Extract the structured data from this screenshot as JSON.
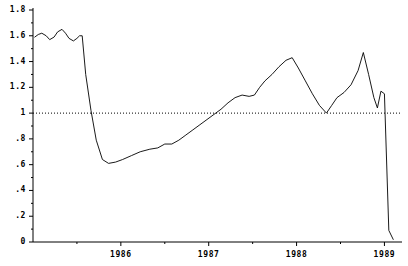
{
  "chart_data": {
    "type": "line",
    "title": "",
    "subtitle": "",
    "xlabel": "",
    "ylabel": "",
    "xlim": [
      1985.0,
      1989.2
    ],
    "ylim": [
      0,
      1.8
    ],
    "grid": false,
    "legend": null,
    "legend_position": "none",
    "line_color": "#000000",
    "axis_color": "#000000",
    "background_color": "#ffffff",
    "reference_line": {
      "name": "unit-reference-line",
      "axis": "y",
      "value": 1.0,
      "style": "dotted",
      "color": "#000000",
      "label": ""
    },
    "y_ticks": [
      0,
      0.2,
      0.4,
      0.6,
      0.8,
      1.0,
      1.2,
      1.4,
      1.6,
      1.8
    ],
    "y_tick_labels": [
      "0",
      ".2",
      ".4",
      ".6",
      ".8",
      "1",
      "1.2",
      "1.4",
      "1.6",
      "1.8"
    ],
    "y_minor_ticks": [
      0.1,
      0.3,
      0.5,
      0.7,
      0.9,
      1.1,
      1.3,
      1.5,
      1.7
    ],
    "x_ticks": [
      1986,
      1987,
      1988,
      1989
    ],
    "x_tick_labels": [
      "1986",
      "1987",
      "1988",
      "1989"
    ],
    "x_minor_ticks": [
      1985.5,
      1986.5,
      1987.5,
      1988.5
    ],
    "series": [
      {
        "name": "ratio-series",
        "color": "#000000",
        "x": [
          1985.02,
          1985.06,
          1985.1,
          1985.15,
          1985.19,
          1985.24,
          1985.28,
          1985.33,
          1985.37,
          1985.41,
          1985.46,
          1985.5,
          1985.53,
          1985.56,
          1985.6,
          1985.66,
          1985.72,
          1985.79,
          1985.86,
          1985.94,
          1986.02,
          1986.12,
          1986.22,
          1986.33,
          1986.42,
          1986.5,
          1986.58,
          1986.66,
          1986.74,
          1986.82,
          1986.9,
          1986.98,
          1987.06,
          1987.14,
          1987.22,
          1987.3,
          1987.38,
          1987.46,
          1987.52,
          1987.58,
          1987.64,
          1987.72,
          1987.8,
          1987.88,
          1987.95,
          1988.02,
          1988.1,
          1988.18,
          1988.26,
          1988.34,
          1988.4,
          1988.46,
          1988.54,
          1988.62,
          1988.7,
          1988.76,
          1988.82,
          1988.88,
          1988.92,
          1988.96,
          1989.0,
          1989.05,
          1989.1
        ],
        "y": [
          1.59,
          1.61,
          1.62,
          1.6,
          1.57,
          1.59,
          1.63,
          1.65,
          1.62,
          1.58,
          1.56,
          1.58,
          1.6,
          1.6,
          1.3,
          1.02,
          0.79,
          0.64,
          0.61,
          0.62,
          0.64,
          0.67,
          0.7,
          0.72,
          0.73,
          0.76,
          0.76,
          0.79,
          0.83,
          0.87,
          0.91,
          0.95,
          0.99,
          1.03,
          1.08,
          1.12,
          1.14,
          1.13,
          1.14,
          1.2,
          1.25,
          1.3,
          1.36,
          1.41,
          1.43,
          1.35,
          1.25,
          1.15,
          1.06,
          1.0,
          1.06,
          1.12,
          1.16,
          1.22,
          1.33,
          1.47,
          1.3,
          1.12,
          1.04,
          1.17,
          1.15,
          0.09,
          0.02
        ],
        "annotations": [
          {
            "name": "initial-plateau",
            "x_range": [
              1985.0,
              1985.55
            ],
            "description": "high plateau oscillating near 1.6"
          },
          {
            "name": "sharp-collapse",
            "x_range": [
              1985.55,
              1985.88
            ],
            "description": "steep drop from 1.60 to 0.61"
          },
          {
            "name": "gradual-recovery",
            "x_range": [
              1985.88,
              1987.95
            ],
            "description": "steady climb from 0.61 to 1.43"
          },
          {
            "name": "first-peak",
            "x": 1987.95,
            "y": 1.43
          },
          {
            "name": "mid-trough",
            "x": 1988.4,
            "y": 1.0
          },
          {
            "name": "second-peak",
            "x": 1988.76,
            "y": 1.47
          },
          {
            "name": "final-plunge",
            "x_range": [
              1989.0,
              1989.1
            ],
            "description": "collapse from 1.15 to near 0"
          }
        ]
      }
    ]
  }
}
